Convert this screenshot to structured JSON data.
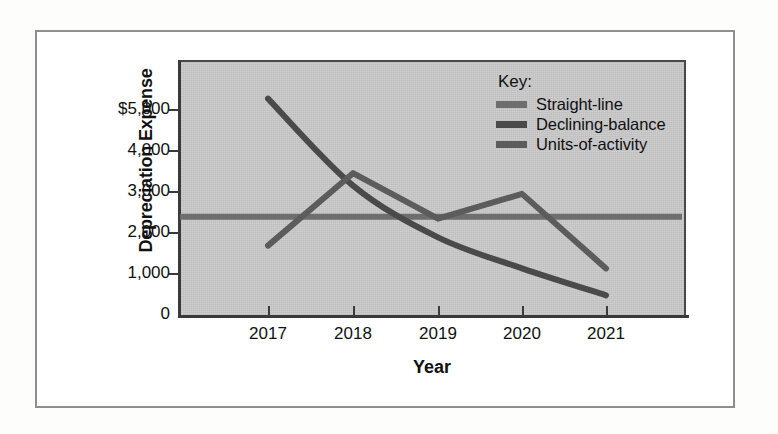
{
  "figure": {
    "plot_background": "#c9c9c9",
    "page_background": "#fdfdfc",
    "frame_color": "#8e8e8e"
  },
  "legend": {
    "title": "Key:",
    "items": [
      {
        "label": "Straight-line",
        "color": "#6e6e6e"
      },
      {
        "label": "Declining-balance",
        "color": "#4a4a4a"
      },
      {
        "label": "Units-of-activity",
        "color": "#5c5c5c"
      }
    ]
  },
  "axes": {
    "y_title": "Depreciation Expense",
    "x_title": "Year",
    "y_ticks": [
      "$5,000",
      "4,000",
      "3,000",
      "2,000",
      "1,000",
      "0"
    ],
    "x_ticks": [
      "2017",
      "2018",
      "2019",
      "2020",
      "2021"
    ]
  },
  "chart_data": {
    "type": "line",
    "title": "",
    "xlabel": "Year",
    "ylabel": "Depreciation Expense",
    "categories": [
      "2017",
      "2018",
      "2019",
      "2020",
      "2021"
    ],
    "x": [
      2017,
      2018,
      2019,
      2020,
      2021
    ],
    "ylim": [
      0,
      5500
    ],
    "xlim": [
      2017,
      2021
    ],
    "grid": false,
    "legend_position": "top-right inside plot",
    "y_tick_values": [
      0,
      1000,
      2000,
      3000,
      4000,
      5000
    ],
    "y_tick_labels": [
      "0",
      "1,000",
      "2,000",
      "3,000",
      "4,000",
      "$5,000"
    ],
    "series": [
      {
        "name": "Straight-line",
        "color": "#6e6e6e",
        "values": [
          2400,
          2400,
          2400,
          2400,
          2400
        ],
        "shape": "flat-horizontal"
      },
      {
        "name": "Declining-balance",
        "color": "#4a4a4a",
        "values": [
          5250,
          3150,
          1900,
          1150,
          500
        ],
        "shape": "smooth-decreasing-curve"
      },
      {
        "name": "Units-of-activity",
        "color": "#5c5c5c",
        "values": [
          1700,
          3450,
          2350,
          2950,
          1150
        ],
        "shape": "zigzag"
      }
    ]
  }
}
